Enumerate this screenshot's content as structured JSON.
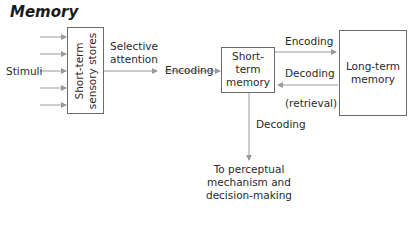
{
  "title": "Memory",
  "nodes": {
    "stimuli": "Stimuli",
    "sensory": "Short-term sensory stores",
    "stm_line1": "Short-",
    "stm_line2": "term",
    "stm_line3": "memory",
    "ltm_line1": "Long-term",
    "ltm_line2": "memory",
    "output_line1": "To perceptual",
    "output_line2": "mechanism and",
    "output_line3": "decision-making"
  },
  "edges": {
    "selective_line1": "Selective",
    "selective_line2": "attention",
    "encoding1": "Encoding",
    "encoding2": "Encoding",
    "decoding_ltm": "Decoding",
    "retrieval": "(retrieval)",
    "decoding_out": "Decoding"
  },
  "colors": {
    "arrow": "#9a9a9a",
    "box_border": "#6b6b6b"
  }
}
